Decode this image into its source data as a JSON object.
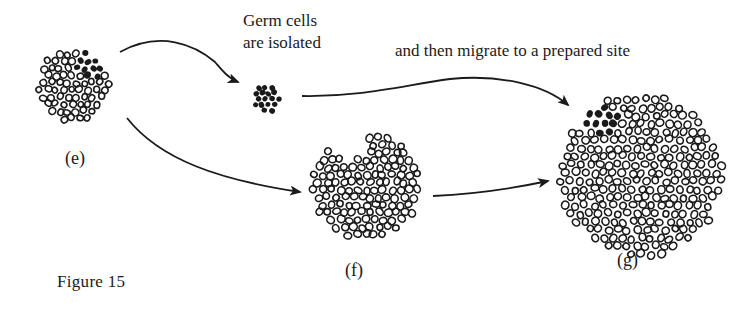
{
  "figure": {
    "caption": "Figure 15",
    "annotations": {
      "isolated_line1": "Germ cells",
      "isolated_line2": "are isolated",
      "migrate": "and then migrate to a prepared site"
    },
    "stages": [
      {
        "id": "e",
        "label": "(e)",
        "description": "Cell cluster with germ cells (filled) among somatic cells (open)"
      },
      {
        "id": "f",
        "label": "(f)",
        "description": "Somatic cell cluster with a notch where germ cells were removed"
      },
      {
        "id": "g",
        "label": "(g)",
        "description": "Large cluster with germ cells settled at prepared site"
      }
    ],
    "germ_cluster": {
      "description": "Isolated group of filled germ cells"
    },
    "arrows": [
      {
        "from": "e",
        "to": "germ_cluster"
      },
      {
        "from": "e",
        "to": "f"
      },
      {
        "from": "germ_cluster",
        "to": "g"
      },
      {
        "from": "f",
        "to": "g"
      }
    ],
    "colors": {
      "ink": "#1a1a1a",
      "background": "#ffffff"
    }
  }
}
